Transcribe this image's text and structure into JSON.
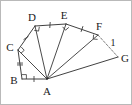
{
  "figure": {
    "canvas": {
      "width": 132,
      "height": 105
    },
    "colors": {
      "stroke": "#2b2b2b",
      "dashed_stroke": "#6a6a6a",
      "mark": "#3a3a3a",
      "label": "#1a1a1a",
      "background": "#ffffff",
      "border": "#b9b9b9"
    },
    "vertices": [
      {
        "id": "A",
        "label": "A",
        "x": 46,
        "y": 78,
        "label_x": 46,
        "label_y": 91
      },
      {
        "id": "B",
        "label": "B",
        "x": 21,
        "y": 78,
        "label_x": 13,
        "label_y": 80
      },
      {
        "id": "C",
        "label": "C",
        "x": 17,
        "y": 49,
        "label_x": 9,
        "label_y": 47
      },
      {
        "id": "D",
        "label": "D",
        "x": 34,
        "y": 25,
        "label_x": 31,
        "label_y": 17
      },
      {
        "id": "E",
        "label": "E",
        "x": 65,
        "y": 23,
        "label_x": 63,
        "label_y": 15
      },
      {
        "id": "F",
        "label": "F",
        "x": 97,
        "y": 34,
        "label_x": 98,
        "label_y": 26
      },
      {
        "id": "G",
        "label": "G",
        "x": 117,
        "y": 56,
        "label_x": 124,
        "label_y": 58
      }
    ],
    "outer_edges": [
      {
        "name": "edge-B-C",
        "from": "B",
        "to": "C"
      },
      {
        "name": "edge-C-D",
        "from": "C",
        "to": "D"
      },
      {
        "name": "edge-D-E",
        "from": "D",
        "to": "E"
      },
      {
        "name": "edge-E-F",
        "from": "E",
        "to": "F"
      },
      {
        "name": "edge-A-B",
        "from": "A",
        "to": "B"
      },
      {
        "name": "edge-A-G",
        "from": "A",
        "to": "G"
      }
    ],
    "spokes": [
      {
        "name": "spoke-A-C",
        "from": "A",
        "to": "C"
      },
      {
        "name": "spoke-A-D",
        "from": "A",
        "to": "D"
      },
      {
        "name": "spoke-A-E",
        "from": "A",
        "to": "E"
      },
      {
        "name": "spoke-A-F",
        "from": "A",
        "to": "F"
      }
    ],
    "dashed_edges": [
      {
        "name": "edge-F-G-dashed",
        "from": "F",
        "to": "G",
        "label": "1",
        "label_x": 112,
        "label_y": 43
      }
    ],
    "tick_marks": [
      {
        "name": "tick-A-B",
        "edge": "A-B",
        "count": 1,
        "x": 33,
        "y": 78,
        "angle": 0
      },
      {
        "name": "tick-B-C",
        "edge": "B-C",
        "count": 2,
        "x": 19,
        "y": 63,
        "angle": 90
      },
      {
        "name": "tick-C-D",
        "edge": "C-D",
        "count": 1,
        "x": 25,
        "y": 37,
        "angle": 55
      },
      {
        "name": "tick-D-E",
        "edge": "D-E",
        "count": 1,
        "x": 49,
        "y": 24,
        "angle": 4
      },
      {
        "name": "tick-E-F",
        "edge": "E-F",
        "count": 1,
        "x": 81,
        "y": 28,
        "angle": 19
      }
    ],
    "right_angle_marks": [
      {
        "name": "right-angle-at-B",
        "vertex": "B",
        "x": 21,
        "y": 78,
        "rotation": 0
      },
      {
        "name": "right-angle-at-C",
        "vertex": "C",
        "x": 17,
        "y": 49,
        "rotation": 48
      },
      {
        "name": "right-angle-at-D",
        "vertex": "D",
        "x": 34,
        "y": 25,
        "rotation": 100
      },
      {
        "name": "right-angle-at-E",
        "vertex": "E",
        "x": 65,
        "y": 23,
        "rotation": 140
      },
      {
        "name": "right-angle-at-F",
        "vertex": "F",
        "x": 97,
        "y": 34,
        "rotation": 185
      }
    ],
    "edge_labels": [
      {
        "name": "edge-label-FG",
        "text": "1",
        "x": 112,
        "y": 43
      }
    ]
  }
}
